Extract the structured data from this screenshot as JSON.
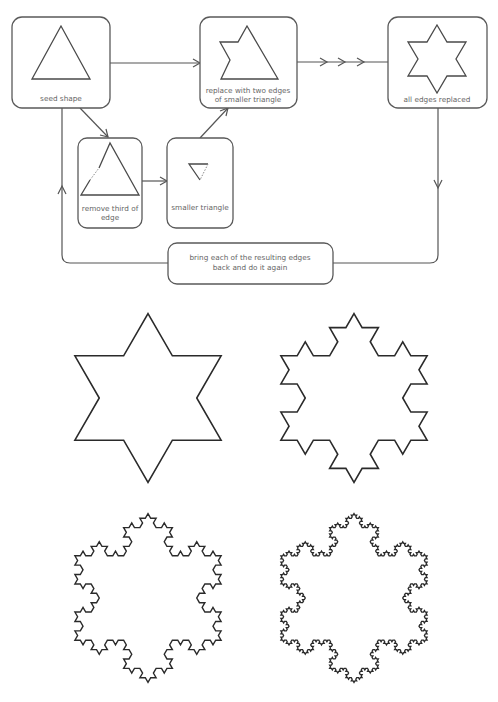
{
  "diagram": {
    "colors": {
      "box_stroke": "#5a5a5a",
      "line": "#555555",
      "label_text": "#666666",
      "fractal_stroke": "#2a2a2a",
      "background": "#ffffff"
    },
    "nodes": [
      {
        "id": "seed",
        "label_lines": [
          "seed shape"
        ],
        "box": [
          12,
          17,
          98,
          91
        ]
      },
      {
        "id": "replace",
        "label_lines": [
          "replace with two edges",
          "of smaller triangle"
        ],
        "box": [
          200,
          17,
          97,
          91
        ]
      },
      {
        "id": "all-edges",
        "label_lines": [
          "all edges replaced"
        ],
        "box": [
          388,
          17,
          99,
          91
        ]
      },
      {
        "id": "remove",
        "label_lines": [
          "remove third of",
          "edge"
        ],
        "box": [
          78,
          138,
          64,
          90
        ]
      },
      {
        "id": "smaller",
        "label_lines": [
          "smaller triangle"
        ],
        "box": [
          167,
          138,
          66,
          90
        ]
      },
      {
        "id": "bring-back",
        "label_lines": [
          "bring each of the resulting edges",
          "back and do it again"
        ],
        "box": [
          168,
          243,
          165,
          41
        ]
      }
    ],
    "edges": [
      {
        "from": "seed",
        "to": "replace",
        "arrows": 1
      },
      {
        "from": "seed",
        "to": "remove",
        "arrows": 1
      },
      {
        "from": "remove",
        "to": "smaller",
        "arrows": 1
      },
      {
        "from": "smaller",
        "to": "replace",
        "arrows": 1
      },
      {
        "from": "replace",
        "to": "all-edges",
        "arrows": 3
      },
      {
        "from": "all-edges",
        "to": "bring-back",
        "arrows": 1
      },
      {
        "from": "bring-back",
        "to": "seed",
        "arrows": 1
      }
    ]
  },
  "fractals": [
    {
      "id": "koch-iteration-1",
      "iterations": 1,
      "center": [
        148,
        398
      ],
      "radius": 97
    },
    {
      "id": "koch-iteration-2",
      "iterations": 2,
      "center": [
        354,
        398
      ],
      "radius": 97
    },
    {
      "id": "koch-iteration-3",
      "iterations": 3,
      "center": [
        148,
        598
      ],
      "radius": 97
    },
    {
      "id": "koch-iteration-4",
      "iterations": 4,
      "center": [
        354,
        598
      ],
      "radius": 97
    }
  ]
}
